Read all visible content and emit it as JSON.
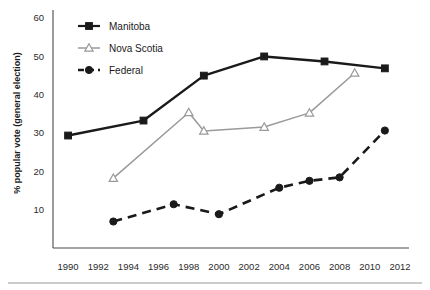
{
  "chart_data": {
    "type": "line",
    "title": "",
    "subtitle": "",
    "xlabel": "",
    "ylabel": "% popular vote (general election)",
    "xlim": [
      1989,
      2012.6
    ],
    "ylim": [
      0,
      62
    ],
    "xticks": [
      1990,
      1992,
      1994,
      1996,
      1998,
      2000,
      2002,
      2004,
      2006,
      2008,
      2010,
      2012
    ],
    "yticks": [
      10,
      20,
      30,
      40,
      50,
      60
    ],
    "grid": false,
    "legend_position": "top-left",
    "series": [
      {
        "name": "Manitoba",
        "color": "#1a1a1a",
        "marker": "square",
        "dash": "solid",
        "points": [
          {
            "x": 1990,
            "y": 29.3
          },
          {
            "x": 1995,
            "y": 33.2
          },
          {
            "x": 1999,
            "y": 44.9
          },
          {
            "x": 2003,
            "y": 49.9
          },
          {
            "x": 2007,
            "y": 48.6
          },
          {
            "x": 2011,
            "y": 46.8
          }
        ]
      },
      {
        "name": "Nova Scotia",
        "color": "#9a9a9a",
        "marker": "triangle",
        "dash": "solid",
        "points": [
          {
            "x": 1993,
            "y": 18.2
          },
          {
            "x": 1998,
            "y": 35.3
          },
          {
            "x": 1999,
            "y": 30.5
          },
          {
            "x": 2003,
            "y": 31.5
          },
          {
            "x": 2006,
            "y": 35.2
          },
          {
            "x": 2009,
            "y": 45.6
          }
        ]
      },
      {
        "name": "Federal",
        "color": "#1a1a1a",
        "marker": "circle",
        "dash": "dashed",
        "points": [
          {
            "x": 1993,
            "y": 6.9
          },
          {
            "x": 1997,
            "y": 11.4
          },
          {
            "x": 2000,
            "y": 8.8
          },
          {
            "x": 2004,
            "y": 15.7
          },
          {
            "x": 2006,
            "y": 17.5
          },
          {
            "x": 2008,
            "y": 18.4
          },
          {
            "x": 2011,
            "y": 30.6
          }
        ]
      }
    ]
  },
  "legend": {
    "items": [
      {
        "label": "Manitoba"
      },
      {
        "label": "Nova Scotia"
      },
      {
        "label": "Federal"
      }
    ]
  }
}
